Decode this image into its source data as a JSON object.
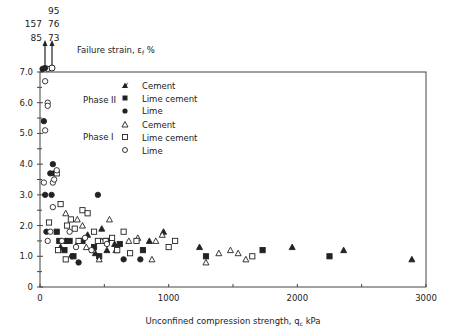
{
  "chart_data": {
    "type": "scatter",
    "title": "Failure strain, εf %",
    "xlabel": "Unconfined compression strength, qc kPa",
    "ylabel": "Failure strain, εf %",
    "xlim": [
      0,
      3000
    ],
    "ylim": [
      0,
      7.0
    ],
    "x_ticks": [
      "0",
      "1000",
      "2000",
      "3000"
    ],
    "y_ticks": [
      "0",
      "1.0",
      "2.0",
      "3.0",
      "4.0",
      "5.0",
      "6.0",
      "7.0"
    ],
    "grid": false,
    "legend_position": "upper-center",
    "legend_groups": [
      {
        "label": "Phase II",
        "entries": [
          "Cement",
          "Lime cement",
          "Lime"
        ]
      },
      {
        "label": "Phase I",
        "entries": [
          "Cement",
          "Lime cement",
          "Lime"
        ]
      }
    ],
    "offscale_annotations": {
      "filled_circle_values": [
        "157",
        "85"
      ],
      "open_circle_values": [
        "95",
        "76",
        "73"
      ]
    },
    "series": [
      {
        "name": "Phase II Cement",
        "marker": "filled-triangle",
        "points": [
          [
            160,
            1.3
          ],
          [
            200,
            1.5
          ],
          [
            300,
            1.5
          ],
          [
            370,
            1.7
          ],
          [
            430,
            1.1
          ],
          [
            480,
            1.9
          ],
          [
            520,
            1.2
          ],
          [
            580,
            1.4
          ],
          [
            850,
            1.5
          ],
          [
            960,
            1.8
          ],
          [
            1240,
            1.3
          ],
          [
            1960,
            1.3
          ],
          [
            2360,
            1.2
          ],
          [
            2890,
            0.9
          ]
        ]
      },
      {
        "name": "Phase II Lime cement",
        "marker": "filled-square",
        "points": [
          [
            130,
            1.8
          ],
          [
            150,
            1.5
          ],
          [
            190,
            1.2
          ],
          [
            230,
            1.5
          ],
          [
            260,
            1.0
          ],
          [
            330,
            1.5
          ],
          [
            420,
            1.3
          ],
          [
            460,
            1.0
          ],
          [
            520,
            1.5
          ],
          [
            620,
            1.4
          ],
          [
            800,
            1.2
          ],
          [
            1290,
            1.0
          ],
          [
            1730,
            1.2
          ],
          [
            2250,
            1.0
          ]
        ]
      },
      {
        "name": "Phase II Lime",
        "marker": "filled-circle",
        "points": [
          [
            20,
            7.1
          ],
          [
            30,
            5.4
          ],
          [
            40,
            3.0
          ],
          [
            50,
            1.8
          ],
          [
            80,
            3.7
          ],
          [
            100,
            4.0
          ],
          [
            110,
            3.7
          ],
          [
            90,
            3.0
          ],
          [
            200,
            1.5
          ],
          [
            250,
            1.0
          ],
          [
            300,
            0.8
          ],
          [
            450,
            3.0
          ],
          [
            650,
            0.9
          ],
          [
            780,
            0.9
          ]
        ]
      },
      {
        "name": "Phase I Cement",
        "marker": "open-triangle",
        "points": [
          [
            200,
            2.4
          ],
          [
            290,
            2.2
          ],
          [
            330,
            2.0
          ],
          [
            360,
            1.3
          ],
          [
            410,
            1.2
          ],
          [
            460,
            0.9
          ],
          [
            480,
            1.5
          ],
          [
            540,
            2.2
          ],
          [
            590,
            1.2
          ],
          [
            690,
            1.5
          ],
          [
            760,
            1.6
          ],
          [
            870,
            0.9
          ],
          [
            900,
            1.5
          ],
          [
            1290,
            0.8
          ],
          [
            1390,
            1.1
          ],
          [
            1480,
            1.2
          ],
          [
            1600,
            0.9
          ],
          [
            1540,
            1.1
          ],
          [
            950,
            1.7
          ]
        ]
      },
      {
        "name": "Phase I Lime cement",
        "marker": "open-square",
        "points": [
          [
            70,
            2.1
          ],
          [
            130,
            3.7
          ],
          [
            160,
            2.7
          ],
          [
            210,
            2.0
          ],
          [
            240,
            2.2
          ],
          [
            270,
            1.9
          ],
          [
            300,
            1.5
          ],
          [
            330,
            2.5
          ],
          [
            370,
            2.4
          ],
          [
            420,
            1.8
          ],
          [
            450,
            1.5
          ],
          [
            510,
            1.5
          ],
          [
            560,
            1.6
          ],
          [
            600,
            1.2
          ],
          [
            650,
            1.8
          ],
          [
            700,
            1.1
          ],
          [
            750,
            1.5
          ],
          [
            1000,
            1.3
          ],
          [
            1050,
            1.5
          ],
          [
            1650,
            1.0
          ],
          [
            200,
            0.9
          ],
          [
            140,
            1.2
          ]
        ]
      },
      {
        "name": "Phase I Lime",
        "marker": "open-circle",
        "points": [
          [
            60,
            7.1
          ],
          [
            40,
            6.7
          ],
          [
            60,
            6.0
          ],
          [
            60,
            5.9
          ],
          [
            40,
            5.1
          ],
          [
            30,
            3.4
          ],
          [
            100,
            3.4
          ],
          [
            110,
            3.5
          ],
          [
            130,
            3.8
          ],
          [
            100,
            2.6
          ],
          [
            80,
            1.8
          ],
          [
            60,
            1.5
          ],
          [
            170,
            1.5
          ],
          [
            230,
            1.8
          ],
          [
            280,
            1.3
          ],
          [
            350,
            1.6
          ],
          [
            400,
            1.2
          ],
          [
            520,
            1.4
          ]
        ]
      }
    ]
  },
  "labels": {
    "failure_strain": "Failure strain, ε",
    "failure_strain_sub": "f",
    "failure_strain_unit": " %",
    "x_axis": "Unconfined compression strength, q",
    "x_axis_sub": "c",
    "x_axis_unit": " kPa",
    "phase2": "Phase II",
    "phase1": "Phase I",
    "legend": [
      "Cement",
      "Lime cement",
      "Lime",
      "Cement",
      "Lime cement",
      "Lime"
    ],
    "off_left_top": "157",
    "off_left_bottom": "85",
    "off_right_top": "95",
    "off_right_mid": "76",
    "off_right_bottom": "73"
  },
  "colors": {
    "ink": "#222222",
    "axis": "#444444"
  }
}
